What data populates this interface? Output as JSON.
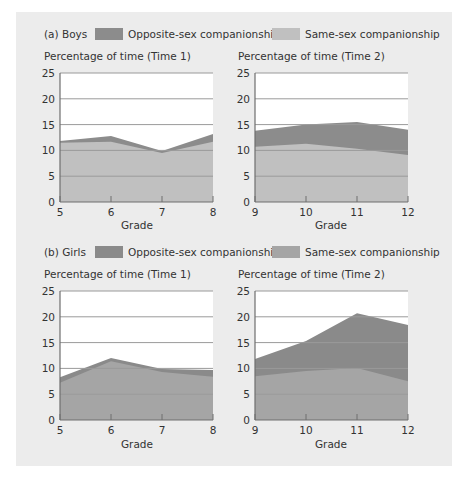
{
  "chart_data": [
    {
      "type": "area",
      "stacked": true,
      "panel": "(a) Boys",
      "title": "Percentage of time (Time 1)",
      "xlabel": "Grade",
      "ylabel": "Percentage of time (Time 1)",
      "categories": [
        5,
        6,
        7,
        8
      ],
      "ylim": [
        0,
        25
      ],
      "yticks": [
        0,
        5,
        10,
        15,
        20,
        25
      ],
      "grid": true,
      "series": [
        {
          "name": "Same-sex companionship",
          "values": [
            11.5,
            11.7,
            9.5,
            11.7
          ]
        },
        {
          "name": "Opposite-sex companionship",
          "values": [
            0.3,
            1.1,
            0.4,
            1.5
          ]
        }
      ],
      "totals": [
        11.8,
        12.8,
        9.9,
        13.2
      ]
    },
    {
      "type": "area",
      "stacked": true,
      "panel": "(a) Boys",
      "title": "Percentage of time (Time 2)",
      "xlabel": "Grade",
      "ylabel": "Percentage of time (Time 2)",
      "categories": [
        9,
        10,
        11,
        12
      ],
      "ylim": [
        0,
        25
      ],
      "yticks": [
        0,
        5,
        10,
        15,
        20,
        25
      ],
      "grid": true,
      "series": [
        {
          "name": "Same-sex companionship",
          "values": [
            10.7,
            11.3,
            10.3,
            9.1
          ]
        },
        {
          "name": "Opposite-sex companionship",
          "values": [
            3.1,
            3.7,
            5.2,
            4.9
          ]
        }
      ],
      "totals": [
        13.8,
        15.0,
        15.5,
        14.0
      ]
    },
    {
      "type": "area",
      "stacked": true,
      "panel": "(b) Girls",
      "title": "Percentage of time (Time 1)",
      "xlabel": "Grade",
      "ylabel": "Percentage of time (Time 1)",
      "categories": [
        5,
        6,
        7,
        8
      ],
      "ylim": [
        0,
        25
      ],
      "yticks": [
        0,
        5,
        10,
        15,
        20,
        25
      ],
      "grid": true,
      "series": [
        {
          "name": "Same-sex companionship",
          "values": [
            7.2,
            11.4,
            9.3,
            8.4
          ]
        },
        {
          "name": "Opposite-sex companionship",
          "values": [
            1.1,
            0.6,
            0.6,
            1.3
          ]
        }
      ],
      "totals": [
        8.3,
        12.0,
        9.9,
        9.7
      ]
    },
    {
      "type": "area",
      "stacked": true,
      "panel": "(b) Girls",
      "title": "Percentage of time (Time 2)",
      "xlabel": "Grade",
      "ylabel": "Percentage of time (Time 2)",
      "categories": [
        9,
        10,
        11,
        12
      ],
      "ylim": [
        0,
        25
      ],
      "yticks": [
        0,
        5,
        10,
        15,
        20,
        25
      ],
      "grid": true,
      "series": [
        {
          "name": "Same-sex companionship",
          "values": [
            8.5,
            9.5,
            10.1,
            7.5
          ]
        },
        {
          "name": "Opposite-sex companionship",
          "values": [
            3.3,
            5.8,
            10.6,
            10.9
          ]
        }
      ],
      "totals": [
        11.8,
        15.3,
        20.7,
        18.4
      ]
    }
  ],
  "sections": [
    {
      "label": "(a) Boys",
      "legend": [
        {
          "label": "Opposite-sex companionship",
          "color": "#8c8c8c"
        },
        {
          "label": "Same-sex companionship",
          "color": "#c0c0c0"
        }
      ],
      "colors": {
        "opposite": "#8c8c8c",
        "same": "#c0c0c0"
      }
    },
    {
      "label": "(b) Girls",
      "legend": [
        {
          "label": "Opposite-sex companionship",
          "color": "#8a8a8a"
        },
        {
          "label": "Same-sex companionship",
          "color": "#a5a5a5"
        }
      ],
      "colors": {
        "opposite": "#8a8a8a",
        "same": "#a5a5a5"
      }
    }
  ],
  "colors": {
    "panel_bg": "#ececec",
    "plot_bg": "#ffffff",
    "grid": "#9a9a9a",
    "axis": "#6e6e6e"
  }
}
